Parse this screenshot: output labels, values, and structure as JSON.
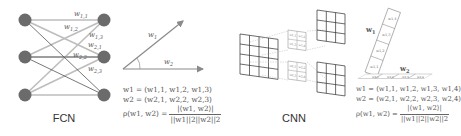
{
  "fcn": {
    "title": "FCN",
    "weight_labels": [
      "w1,1",
      "w1,2",
      "w1,3",
      "w2,1",
      "w2,2",
      "w2,3"
    ],
    "input_nodes": 3,
    "output_nodes": 3,
    "vector_labels": {
      "w1": "w1",
      "w2": "w2"
    },
    "formula": {
      "line1": "w1 = (w1,1, w1,2, w1,3)",
      "line2": "w2 = (w2,1, w2,2, w2,3)",
      "line3_lhs": "ρ(w1, w2) =",
      "line3_num": "|⟨w1, w2⟩|",
      "line3_den": "||w1||2||w2||2"
    }
  },
  "cnn": {
    "title": "CNN",
    "input_grid": "4x4",
    "output_grids": "3x3",
    "kernel_cells_top": [
      "w1,1",
      "w1,2",
      "w1,3",
      "w1,4"
    ],
    "kernel_cells_bottom": [
      "w2,1",
      "w2,2",
      "w2,3",
      "w2,4"
    ],
    "vector_labels": {
      "w1": "w1",
      "w2": "w2"
    },
    "w1_cells": [
      "w1,1",
      "w1,2",
      "w1,3",
      "w1,4"
    ],
    "w2_cells": [
      "w2,1",
      "w2,2",
      "w2,3",
      "w2,4"
    ],
    "formula": {
      "line1": "w1 = (w1,1, w1,2, w1,3, w1,4)",
      "line2": "w2 = (w2,1, w2,2, w2,3, w2,4)",
      "line3_lhs": "ρ(w1, w2) =",
      "line3_num": "|⟨w1, w2⟩|",
      "line3_den": "||w1||2||w2||2"
    }
  },
  "colors": {
    "node": "#6b6b6b",
    "edge_light": "#b9b9b9",
    "edge_dark": "#555555",
    "arrow": "#8a8a8a",
    "grid": "#333333",
    "kernel": "#9a9a9a"
  }
}
